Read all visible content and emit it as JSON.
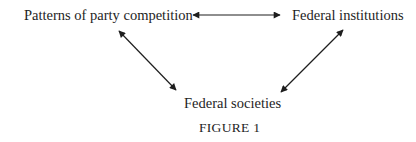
{
  "diagram": {
    "nodes": [
      {
        "id": "party",
        "label": "Patterns of party competition"
      },
      {
        "id": "institutions",
        "label": "Federal institutions"
      },
      {
        "id": "societies",
        "label": "Federal societies"
      }
    ],
    "edges": [
      {
        "from": "party",
        "to": "institutions",
        "type": "bidirectional"
      },
      {
        "from": "party",
        "to": "societies",
        "type": "bidirectional"
      },
      {
        "from": "institutions",
        "to": "societies",
        "type": "bidirectional"
      }
    ],
    "caption": "FIGURE 1",
    "colors": {
      "text": "#1e1e1e",
      "arrow": "#1e1e1e",
      "background": "#ffffff"
    }
  }
}
